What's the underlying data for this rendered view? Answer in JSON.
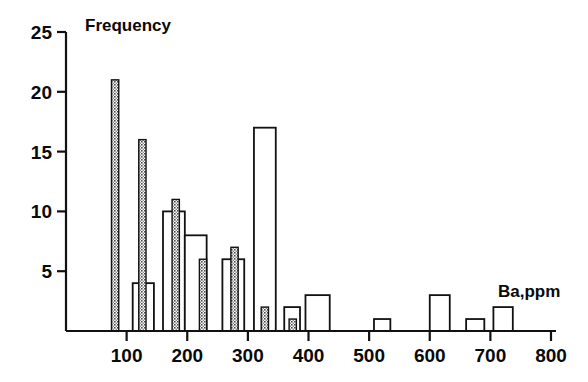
{
  "chart_data": {
    "type": "bar",
    "title": "",
    "subtitle": "",
    "xlabel": "Ba,ppm",
    "ylabel": "Frequency",
    "xlim": [
      0,
      800
    ],
    "ylim": [
      0,
      25
    ],
    "xticks": [
      100,
      200,
      300,
      400,
      500,
      600,
      700,
      800
    ],
    "yticks": [
      5,
      10,
      15,
      20,
      25
    ],
    "grid": false,
    "legend": false,
    "bin_width": 25,
    "series": [
      {
        "name": "shaded",
        "style": "stippled-gray",
        "color": "#6e6e6e",
        "bars": [
          {
            "x_start": 75,
            "x_end": 87,
            "value": 21
          },
          {
            "x_start": 120,
            "x_end": 132,
            "value": 16
          },
          {
            "x_start": 175,
            "x_end": 187,
            "value": 11
          },
          {
            "x_start": 220,
            "x_end": 232,
            "value": 6
          },
          {
            "x_start": 272,
            "x_end": 284,
            "value": 7
          },
          {
            "x_start": 322,
            "x_end": 334,
            "value": 2
          },
          {
            "x_start": 368,
            "x_end": 380,
            "value": 1
          }
        ]
      },
      {
        "name": "open",
        "style": "outline-white",
        "color": "#ffffff",
        "bars": [
          {
            "x_start": 110,
            "x_end": 145,
            "value": 4
          },
          {
            "x_start": 160,
            "x_end": 196,
            "value": 10
          },
          {
            "x_start": 196,
            "x_end": 232,
            "value": 8
          },
          {
            "x_start": 258,
            "x_end": 294,
            "value": 6
          },
          {
            "x_start": 310,
            "x_end": 346,
            "value": 17
          },
          {
            "x_start": 360,
            "x_end": 386,
            "value": 2
          },
          {
            "x_start": 395,
            "x_end": 435,
            "value": 3
          },
          {
            "x_start": 508,
            "x_end": 535,
            "value": 1
          },
          {
            "x_start": 600,
            "x_end": 633,
            "value": 3
          },
          {
            "x_start": 660,
            "x_end": 690,
            "value": 1
          },
          {
            "x_start": 705,
            "x_end": 737,
            "value": 2
          }
        ]
      }
    ]
  },
  "axes": {
    "y_title": "Frequency",
    "x_title": "Ba,ppm",
    "y_tick_labels": [
      "25",
      "20",
      "15",
      "10",
      "5"
    ],
    "x_tick_labels": [
      "100",
      "200",
      "300",
      "400",
      "500",
      "600",
      "700",
      "800"
    ]
  }
}
